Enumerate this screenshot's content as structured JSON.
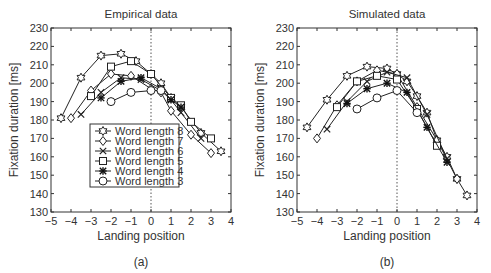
{
  "chart_data": [
    {
      "type": "line",
      "title": "Empirical data",
      "caption": "(a)",
      "xlabel": "Landing position",
      "ylabel": "Fixation duration [ms]",
      "xlim": [
        -5,
        4
      ],
      "ylim": [
        130,
        230
      ],
      "xticks": [
        "−5",
        "−4",
        "−3",
        "−2",
        "−1",
        "0",
        "1",
        "2",
        "3",
        "4"
      ],
      "yticks": [
        "130",
        "140",
        "150",
        "160",
        "170",
        "180",
        "190",
        "200",
        "210",
        "220",
        "230"
      ],
      "grid": false,
      "reference_line_x": 0,
      "legend_position": "lower-left inside",
      "series": [
        {
          "name": "Word length 8",
          "marker": "star",
          "x": [
            -4.5,
            -3.5,
            -2.5,
            -1.5,
            -0.75,
            0,
            0.5,
            1,
            1.5,
            2.5,
            3.5
          ],
          "y": [
            181,
            203,
            215,
            216,
            212,
            205,
            200,
            192,
            187,
            173,
            163
          ]
        },
        {
          "name": "Word length 7",
          "marker": "diamond",
          "x": [
            -4,
            -3,
            -2,
            -1,
            0,
            0.5,
            1,
            2,
            3
          ],
          "y": [
            181,
            196,
            205,
            204,
            197,
            195,
            185,
            172,
            162
          ]
        },
        {
          "name": "Word length 6",
          "marker": "x",
          "x": [
            -3.5,
            -2.5,
            -1.5,
            -0.5,
            0.5,
            1,
            1.5,
            2.5
          ],
          "y": [
            183,
            195,
            203,
            202,
            196,
            191,
            184,
            170
          ]
        },
        {
          "name": "Word length 5",
          "marker": "square",
          "x": [
            -3,
            -2,
            -1,
            0,
            1,
            1.5,
            2,
            3
          ],
          "y": [
            193,
            209,
            212,
            205,
            192,
            188,
            179,
            170
          ]
        },
        {
          "name": "Word length 4",
          "marker": "asterisk",
          "x": [
            -2.5,
            -1.5,
            -0.5,
            0.5,
            1,
            1.5
          ],
          "y": [
            192,
            201,
            203,
            197,
            191,
            187
          ]
        },
        {
          "name": "Word length 3",
          "marker": "circle",
          "x": [
            -2,
            -1,
            0,
            0.5
          ],
          "y": [
            190,
            195,
            196,
            196
          ]
        }
      ]
    },
    {
      "type": "line",
      "title": "Simulated data",
      "caption": "(b)",
      "xlabel": "Landing position",
      "ylabel": "Fixation duration [ms]",
      "xlim": [
        -5,
        4
      ],
      "ylim": [
        130,
        230
      ],
      "xticks": [
        "−5",
        "−4",
        "−3",
        "−2",
        "−1",
        "0",
        "1",
        "2",
        "3",
        "4"
      ],
      "yticks": [
        "130",
        "140",
        "150",
        "160",
        "170",
        "180",
        "190",
        "200",
        "210",
        "220",
        "230"
      ],
      "grid": false,
      "reference_line_x": 0,
      "series": [
        {
          "name": "Word length 8",
          "marker": "star",
          "x": [
            -4.5,
            -3.5,
            -2.5,
            -1.5,
            -0.5,
            0,
            0.5,
            1,
            1.5,
            2,
            2.5,
            3,
            3.5
          ],
          "y": [
            176,
            191,
            204,
            209,
            208,
            205,
            201,
            193,
            184,
            169,
            160,
            148,
            139
          ]
        },
        {
          "name": "Word length 7",
          "marker": "diamond",
          "x": [
            -4,
            -3,
            -2,
            -1,
            0,
            1,
            2,
            3
          ],
          "y": [
            170,
            188,
            201,
            207,
            205,
            187,
            169,
            148
          ]
        },
        {
          "name": "Word length 6",
          "marker": "x",
          "x": [
            -3.5,
            -2.5,
            -1.5,
            -0.5,
            0.5,
            1.5,
            2.5
          ],
          "y": [
            175,
            190,
            201,
            206,
            203,
            183,
            159
          ]
        },
        {
          "name": "Word length 5",
          "marker": "square",
          "x": [
            -3,
            -2,
            -1,
            0,
            1,
            2
          ],
          "y": [
            187,
            201,
            204,
            202,
            186,
            166
          ]
        },
        {
          "name": "Word length 4",
          "marker": "asterisk",
          "x": [
            -2.5,
            -1.5,
            -0.5,
            0.5,
            1.5,
            2.5
          ],
          "y": [
            189,
            197,
            200,
            195,
            176,
            157
          ]
        },
        {
          "name": "Word length 3",
          "marker": "circle",
          "x": [
            -2,
            -1,
            0,
            1
          ],
          "y": [
            186,
            192,
            196,
            184
          ]
        }
      ]
    }
  ],
  "legend": {
    "items": [
      "Word length 8",
      "Word length 7",
      "Word length 6",
      "Word length 5",
      "Word length 4",
      "Word length 3"
    ]
  }
}
